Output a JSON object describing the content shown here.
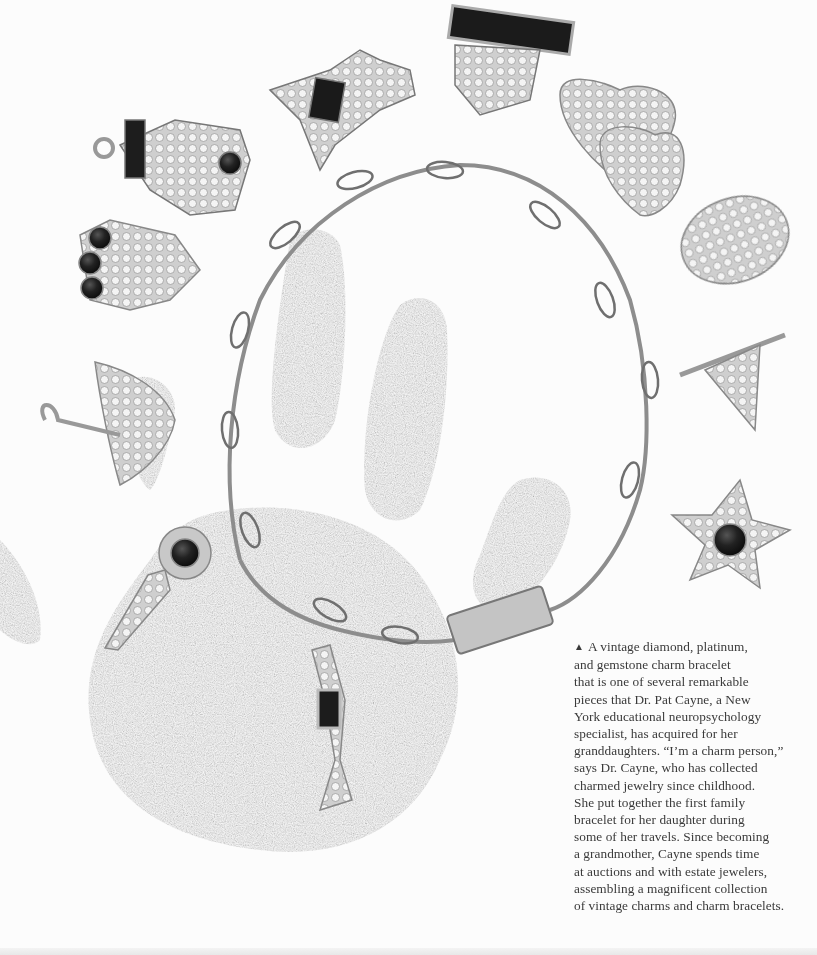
{
  "photo": {
    "subject": "Vintage diamond, platinum, and gemstone charm bracelet on a handprint",
    "charms": [
      {
        "name": "cat"
      },
      {
        "name": "dog"
      },
      {
        "name": "sapphire bar"
      },
      {
        "name": "double hearts"
      },
      {
        "name": "leaf oval"
      },
      {
        "name": "pennant flag"
      },
      {
        "name": "star"
      },
      {
        "name": "clock / anchor"
      },
      {
        "name": "umbrella"
      },
      {
        "name": "key"
      },
      {
        "name": "cocktail glass"
      }
    ],
    "colors": {
      "ink": "#8a8a8a",
      "metal": "#b9b9b9",
      "stone": "#1c1c1c",
      "paper": "#fcfcfc"
    }
  },
  "caption": {
    "marker": "▲",
    "lines": [
      "A vintage diamond, platinum,",
      "and gemstone charm bracelet",
      "that is one of several remarkable",
      "pieces that Dr. Pat Cayne, a New",
      "York educational neuropsychology",
      "specialist, has acquired for her",
      "granddaughters. “I’m a charm person,”",
      "says Dr. Cayne, who has collected",
      "charmed jewelry since childhood.",
      "She put together the first family",
      "bracelet for her daughter during",
      "some of her travels. Since becoming",
      "a grandmother, Cayne spends time",
      "at auctions and with estate jewelers,",
      "assembling a magnificent collection",
      "of vintage charms and charm bracelets."
    ]
  }
}
